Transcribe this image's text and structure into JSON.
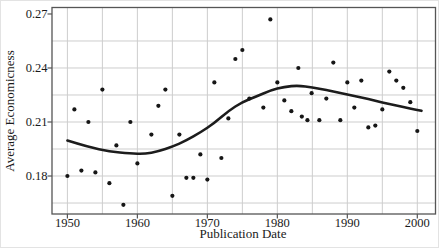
{
  "chart_data": {
    "type": "scatter",
    "title": "",
    "xlabel": "Publication Date",
    "ylabel": "Average Economicness",
    "xlim": [
      1947.8,
      2002.6
    ],
    "ylim": [
      0.1589,
      0.2736
    ],
    "grid": "on",
    "legend": "none",
    "x_major_ticks": [
      {
        "v": 1950,
        "label": "1950"
      },
      {
        "v": 1960,
        "label": "1960"
      },
      {
        "v": 1970,
        "label": "1970"
      },
      {
        "v": 1980,
        "label": "1980"
      },
      {
        "v": 1990,
        "label": "1990"
      },
      {
        "v": 2000,
        "label": "2000"
      }
    ],
    "y_major_ticks": [
      {
        "v": 0.18,
        "label": "0.18"
      },
      {
        "v": 0.21,
        "label": "0.21"
      },
      {
        "v": 0.24,
        "label": "0.24"
      },
      {
        "v": 0.27,
        "label": "0.27"
      }
    ],
    "x_gridlines": [
      1950,
      1955,
      1960,
      1965,
      1970,
      1975,
      1980,
      1985,
      1990,
      1995,
      2000
    ],
    "y_gridlines": [
      0.165,
      0.18,
      0.195,
      0.21,
      0.225,
      0.24,
      0.255
    ],
    "points": [
      [
        1950,
        0.18
      ],
      [
        1951,
        0.217
      ],
      [
        1952,
        0.183
      ],
      [
        1953,
        0.21
      ],
      [
        1954,
        0.182
      ],
      [
        1955,
        0.228
      ],
      [
        1956,
        0.176
      ],
      [
        1957,
        0.197
      ],
      [
        1958,
        0.164
      ],
      [
        1959,
        0.21
      ],
      [
        1960,
        0.187
      ],
      [
        1962,
        0.203
      ],
      [
        1963,
        0.219
      ],
      [
        1964,
        0.228
      ],
      [
        1965,
        0.169
      ],
      [
        1966,
        0.203
      ],
      [
        1967,
        0.179
      ],
      [
        1968,
        0.179
      ],
      [
        1969,
        0.192
      ],
      [
        1970,
        0.178
      ],
      [
        1971,
        0.232
      ],
      [
        1972,
        0.19
      ],
      [
        1973,
        0.212
      ],
      [
        1974,
        0.245
      ],
      [
        1975,
        0.25
      ],
      [
        1976,
        0.223
      ],
      [
        1978,
        0.218
      ],
      [
        1979,
        0.267
      ],
      [
        1980,
        0.232
      ],
      [
        1981,
        0.222
      ],
      [
        1982,
        0.216
      ],
      [
        1983,
        0.24
      ],
      [
        1983.5,
        0.213
      ],
      [
        1984.3,
        0.211
      ],
      [
        1984.9,
        0.226
      ],
      [
        1986,
        0.211
      ],
      [
        1987,
        0.223
      ],
      [
        1988,
        0.243
      ],
      [
        1989,
        0.211
      ],
      [
        1990,
        0.232
      ],
      [
        1991,
        0.218
      ],
      [
        1992,
        0.233
      ],
      [
        1993,
        0.207
      ],
      [
        1994,
        0.208
      ],
      [
        1995,
        0.217
      ],
      [
        1996,
        0.238
      ],
      [
        1997,
        0.233
      ],
      [
        1998,
        0.229
      ],
      [
        1999,
        0.221
      ],
      [
        2000,
        0.205
      ]
    ],
    "trend_line": [
      [
        1950,
        0.1997
      ],
      [
        1953,
        0.1961
      ],
      [
        1956,
        0.1936
      ],
      [
        1959,
        0.1925
      ],
      [
        1961,
        0.1922
      ],
      [
        1963,
        0.1937
      ],
      [
        1965,
        0.1963
      ],
      [
        1967,
        0.1997
      ],
      [
        1969,
        0.2042
      ],
      [
        1971,
        0.2094
      ],
      [
        1973,
        0.2161
      ],
      [
        1975,
        0.2211
      ],
      [
        1977,
        0.2242
      ],
      [
        1979,
        0.2275
      ],
      [
        1981,
        0.2296
      ],
      [
        1983,
        0.2303
      ],
      [
        1985,
        0.2292
      ],
      [
        1987,
        0.2278
      ],
      [
        1989,
        0.2261
      ],
      [
        1991,
        0.2244
      ],
      [
        1993,
        0.2228
      ],
      [
        1995,
        0.2208
      ],
      [
        1997,
        0.2192
      ],
      [
        1999,
        0.2175
      ],
      [
        2000.6,
        0.2162
      ]
    ],
    "colors": {
      "background": "#ffffff",
      "frame": "#555555",
      "grid": "#cdcdcd",
      "point": "#161616",
      "trend": "#1c1c1c",
      "text": "#1a1a1a"
    },
    "point_radius": 2.1,
    "trend_width": 2.6
  }
}
